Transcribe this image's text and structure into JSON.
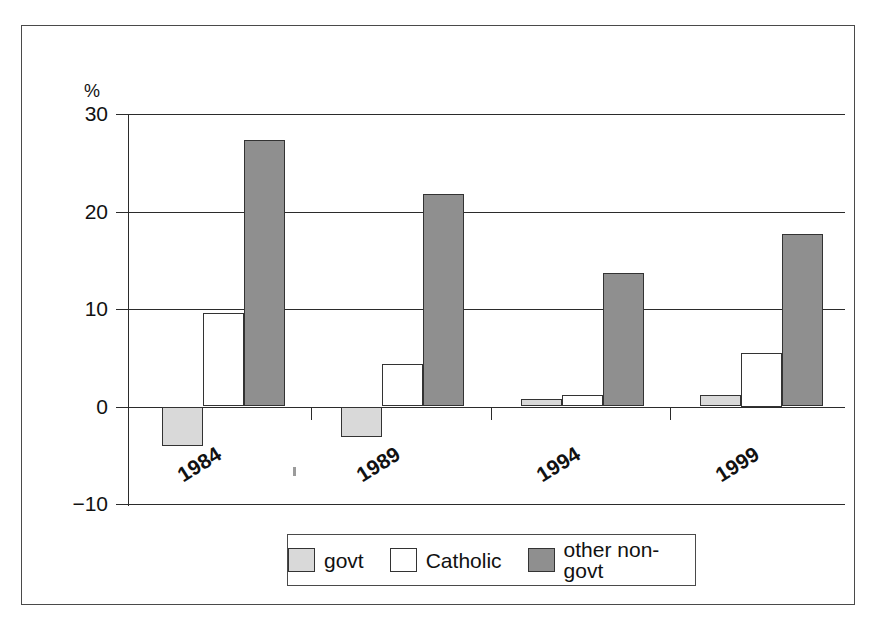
{
  "chart_data": {
    "type": "bar",
    "title": "",
    "subtitle": "",
    "xlabel": "",
    "ylabel": "",
    "unit_label": "%",
    "categories": [
      "1984",
      "1989",
      "1994",
      "1999"
    ],
    "series": [
      {
        "name": "govt",
        "color": "#d9d9d9",
        "values": [
          -4.0,
          -3.1,
          0.8,
          1.2
        ]
      },
      {
        "name": "Catholic",
        "color": "#ffffff",
        "values": [
          9.6,
          4.4,
          1.2,
          5.5
        ]
      },
      {
        "name": "other non-govt",
        "color": "#8f8f8f",
        "values": [
          27.3,
          21.8,
          13.7,
          17.7
        ]
      }
    ],
    "ylim": [
      -10,
      30
    ],
    "yticks": [
      30,
      20,
      10,
      0,
      -10
    ],
    "ytick_labels": [
      "30",
      "20",
      "10",
      "0",
      "−10"
    ],
    "grid": true,
    "legend_position": "bottom-center",
    "legend_entries": [
      "govt",
      "Catholic",
      "other non-govt"
    ]
  },
  "axis": {
    "unit": "%",
    "ticks": [
      {
        "label": "30",
        "value": 30
      },
      {
        "label": "20",
        "value": 20
      },
      {
        "label": "10",
        "value": 10
      },
      {
        "label": "0",
        "value": 0
      },
      {
        "label": "−10",
        "value": -10
      }
    ]
  },
  "x_axis": {
    "labels": [
      "1984",
      "1989",
      "1994",
      "1999"
    ]
  },
  "legend": {
    "items": [
      {
        "label": "govt",
        "swatch": "light-gray"
      },
      {
        "label": "Catholic",
        "swatch": "white"
      },
      {
        "label": "other non-govt",
        "swatch": "dark-gray"
      }
    ]
  },
  "colors": {
    "govt": "#d9d9d9",
    "catholic": "#ffffff",
    "other_non_govt": "#8f8f8f",
    "axis": "#2b2b2b",
    "frame": "#4a4a4a"
  }
}
